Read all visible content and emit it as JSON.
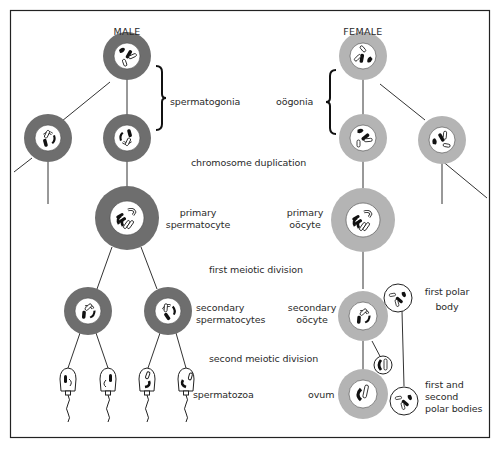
{
  "diagram": {
    "type": "gametogenesis-comparison",
    "colors": {
      "male_cytoplasm": "#6e6e6e",
      "female_cytoplasm": "#b4b4b4",
      "nucleus": "#ffffff",
      "line": "#333333",
      "frame": "#222222"
    },
    "columns": {
      "male": {
        "title": "MALE"
      },
      "female": {
        "title": "FEMALE"
      }
    },
    "labels": {
      "spermatogonia": "spermatogonia",
      "oogonia": "oögonia",
      "chromosome_duplication": "chromosome duplication",
      "primary_spermatocyte_1": "primary",
      "primary_spermatocyte_2": "spermatocyte",
      "primary_oocyte_1": "primary",
      "primary_oocyte_2": "oöcyte",
      "first_meiotic_division": "first meiotic division",
      "secondary_spermatocytes_1": "secondary",
      "secondary_spermatocytes_2": "spermatocytes",
      "secondary_oocyte_1": "secondary",
      "secondary_oocyte_2": "oöcyte",
      "first_polar_body_1": "first polar",
      "first_polar_body_2": "body",
      "second_meiotic_division": "second meiotic division",
      "spermatozoa": "spermatozoa",
      "ovum": "ovum",
      "polar_bodies_1": "first and",
      "polar_bodies_2": "second",
      "polar_bodies_3": "polar bodies"
    },
    "stages": [
      "spermatogonia / oögonia",
      "chromosome duplication",
      "primary spermatocyte / primary oöcyte",
      "first meiotic division",
      "secondary spermatocytes / secondary oöcyte + first polar body",
      "second meiotic division",
      "spermatozoa / ovum + first and second polar bodies"
    ]
  }
}
